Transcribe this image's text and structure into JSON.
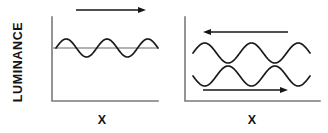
{
  "figure": {
    "name": "luminance-vs-x-motion-diagram",
    "background_color": "#ffffff",
    "width": 328,
    "height": 133,
    "axis_color": "#7a7a7a",
    "wave_color": "#1a1a1a",
    "baseline_color": "#9a9a9a",
    "arrow_color": "#161616"
  },
  "labels": {
    "y_axis": "LUMINANCE",
    "x_axis_left": "X",
    "x_axis_right": "X"
  },
  "icons": {
    "arrow_right": "arrow-right-icon",
    "arrow_left": "arrow-left-icon"
  },
  "chart_data": {
    "type": "line",
    "title": "",
    "xlabel": "X",
    "ylabel": "LUMINANCE",
    "grid": false,
    "legend": "none",
    "panels": [
      {
        "id": "left-panel",
        "name": "single-grating-panel",
        "axis": {
          "x_origin": 52,
          "y_top": 17,
          "y_bottom": 101,
          "x_end": 158
        },
        "baselines": [
          {
            "name": "mean-luminance-baseline",
            "y": 48,
            "x_start": 52,
            "x_end": 158
          }
        ],
        "waves": [
          {
            "name": "luminance-grating-wave",
            "center_y": 48,
            "amplitude": 9,
            "cycles": 2.5,
            "x_start": 56,
            "x_end": 158,
            "phase_deg": 0
          }
        ],
        "arrows": [
          {
            "name": "motion-arrow-top",
            "direction": "right",
            "y": 10,
            "x_start": 76,
            "x_end": 146
          }
        ],
        "x_label": "X",
        "x_label_x": 102,
        "x_label_y": 124
      },
      {
        "id": "right-panel",
        "name": "dual-grating-panel",
        "axis": {
          "x_origin": 185,
          "y_top": 17,
          "y_bottom": 101,
          "x_end": 320
        },
        "baselines": [],
        "waves": [
          {
            "name": "upper-luminance-wave",
            "center_y": 53,
            "amplitude": 10,
            "cycles": 2.5,
            "x_start": 193,
            "x_end": 310,
            "phase_deg": 0
          },
          {
            "name": "lower-luminance-wave",
            "center_y": 76,
            "amplitude": 10,
            "cycles": 2.5,
            "x_start": 193,
            "x_end": 310,
            "phase_deg": 180
          }
        ],
        "arrows": [
          {
            "name": "motion-arrow-top",
            "direction": "left",
            "y": 32,
            "x_start": 203,
            "x_end": 288
          },
          {
            "name": "motion-arrow-bottom",
            "direction": "right",
            "y": 90,
            "x_start": 203,
            "x_end": 288
          }
        ],
        "x_label": "X",
        "x_label_x": 252,
        "x_label_y": 124
      }
    ]
  }
}
